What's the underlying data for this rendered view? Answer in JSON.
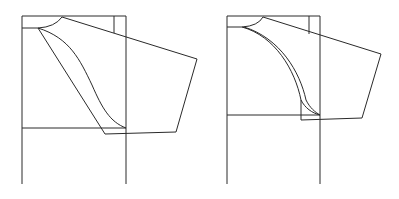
{
  "figure": {
    "line_color": "#2a2a2a",
    "background": "#ffffff",
    "panels": [
      {
        "id": "left",
        "label": "",
        "curve_style": "single S-curve armhole with straight underarm seam"
      },
      {
        "id": "right",
        "label": "",
        "curve_style": "double convex armhole curves"
      }
    ]
  }
}
